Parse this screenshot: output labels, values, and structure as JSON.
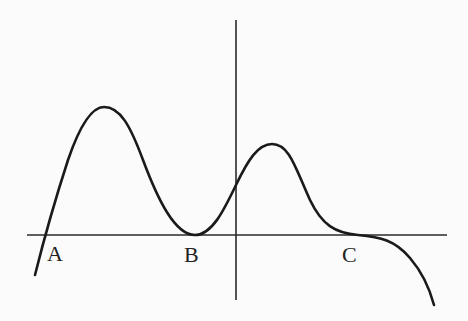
{
  "diagram": {
    "type": "function-graph",
    "labels": {
      "A": "A",
      "B": "B",
      "C": "C"
    },
    "points": [
      {
        "name": "A",
        "description": "curve crosses x-axis (simple root)"
      },
      {
        "name": "B",
        "description": "curve touches x-axis (local minimum, double root)"
      },
      {
        "name": "C",
        "description": "curve flattens on x-axis (inflection, triple root)"
      }
    ],
    "colors": {
      "stroke": "#1a1a1a",
      "background": "#fbfbfb"
    }
  }
}
